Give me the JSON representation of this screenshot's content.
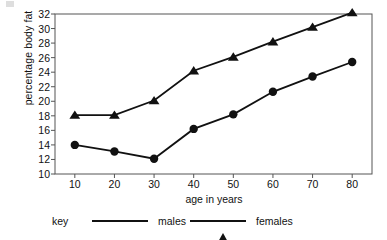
{
  "chart_data": {
    "type": "line",
    "title": "",
    "xlabel": "age in years",
    "ylabel": "percentage body fat",
    "x": [
      10,
      20,
      30,
      40,
      50,
      60,
      70,
      80
    ],
    "xtick_labels": [
      "10",
      "20",
      "30",
      "40",
      "50",
      "60",
      "70",
      "80"
    ],
    "ytick_labels": [
      "32",
      "30",
      "28",
      "26",
      "24",
      "22",
      "20",
      "18",
      "16",
      "14",
      "12",
      "10"
    ],
    "yticks": [
      32,
      30,
      28,
      26,
      24,
      22,
      20,
      18,
      16,
      14,
      12,
      10
    ],
    "xlim": [
      5,
      85
    ],
    "ylim": [
      10,
      32
    ],
    "grid": false,
    "legend_position": "below-axes",
    "legend_title": "key",
    "series": [
      {
        "name": "males",
        "marker": "circle",
        "color": "#111111",
        "values": [
          14.0,
          13.1,
          12.1,
          16.2,
          18.2,
          21.3,
          23.4,
          25.4
        ]
      },
      {
        "name": "females",
        "marker": "triangle",
        "color": "#111111",
        "values": [
          18.1,
          18.1,
          20.1,
          24.2,
          26.1,
          28.2,
          30.2,
          32.2
        ]
      }
    ]
  },
  "legend": {
    "key_label": "key",
    "entries": [
      {
        "label": "males",
        "marker": "circle-marker-icon"
      },
      {
        "label": "females",
        "marker": "triangle-marker-icon"
      }
    ]
  },
  "axes": {
    "x_title": "age in years",
    "y_title": "percentage body fat"
  }
}
